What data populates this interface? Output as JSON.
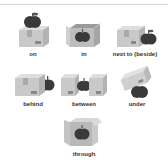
{
  "items": [
    {
      "label": "on"
    },
    {
      "label": "in"
    },
    {
      "label": "next to (beside)"
    },
    {
      "label": "behind"
    },
    {
      "label": "between"
    },
    {
      "label": "under"
    },
    {
      "label": "through"
    }
  ],
  "colors": {
    "box_front": "#c9c9c9",
    "box_side": "#b3b3b3",
    "box_top": "#dedede",
    "apple": "#3a3a3a",
    "leaf": "#555555"
  }
}
